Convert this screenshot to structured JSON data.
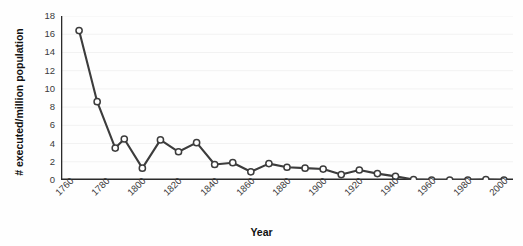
{
  "figure": {
    "title_remnant": "",
    "bg_color": "#fefefe",
    "line_color": "#3c3c3c",
    "marker_face": "#ffffff",
    "marker_edge": "#3c3c3c",
    "axis_color": "#2b2b2b",
    "grid_color": "#f2f2f2"
  },
  "chart_data": {
    "type": "line",
    "title": "",
    "xlabel": "Year",
    "ylabel": "# executed/million population",
    "xlim": [
      1760,
      2010
    ],
    "ylim": [
      0,
      18
    ],
    "grid": true,
    "legend": null,
    "ytick_labels": [
      "0",
      "2",
      "4",
      "6",
      "8",
      "10",
      "12",
      "14",
      "16",
      "18"
    ],
    "yticks": [
      0,
      2,
      4,
      6,
      8,
      10,
      12,
      14,
      16,
      18
    ],
    "xtick_labels": [
      "1760",
      "1780",
      "1800",
      "1820",
      "1840",
      "1860",
      "1880",
      "1900",
      "1920",
      "1940",
      "1960",
      "1980",
      "2000"
    ],
    "xticks": [
      1760,
      1780,
      1800,
      1820,
      1840,
      1860,
      1880,
      1900,
      1920,
      1940,
      1960,
      1980,
      2000
    ],
    "xminor_step": 10,
    "series": [
      {
        "name": "executions per million population",
        "marker": "circle",
        "x": [
          1770,
          1780,
          1790,
          1795,
          1805,
          1815,
          1825,
          1835,
          1845,
          1855,
          1865,
          1875,
          1885,
          1895,
          1905,
          1915,
          1925,
          1935,
          1945,
          1955,
          1965,
          1975,
          1985,
          1995,
          2005
        ],
        "values": [
          16.4,
          8.6,
          3.5,
          4.5,
          1.3,
          4.4,
          3.1,
          4.1,
          1.7,
          1.9,
          0.9,
          1.8,
          1.4,
          1.3,
          1.2,
          0.6,
          1.1,
          0.7,
          0.4,
          0.05,
          0.0,
          0.0,
          0.0,
          0.05,
          0.0
        ]
      }
    ]
  }
}
